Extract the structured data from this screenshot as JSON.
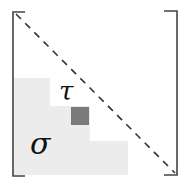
{
  "diagram": {
    "type": "matrix-partition",
    "labels": {
      "tau": "τ",
      "sigma": "σ"
    },
    "colors": {
      "bracket": "#444444",
      "diagonal": "#333333",
      "region_fill": "#ececec",
      "highlight_cell": "#7a7a7a",
      "label": "#111111"
    }
  }
}
